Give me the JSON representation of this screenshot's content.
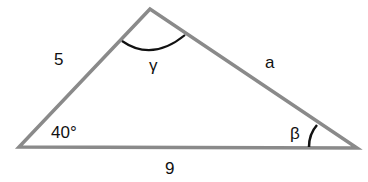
{
  "diagram": {
    "type": "triangle",
    "vertices": {
      "top": [
        150,
        9
      ],
      "left": [
        19,
        147
      ],
      "right": [
        357,
        148
      ]
    },
    "side_labels": {
      "left_side": "5",
      "right_side": "a",
      "base": "9"
    },
    "angle_labels": {
      "left_angle": "40°",
      "top_angle": "γ",
      "right_angle": "β"
    },
    "colors": {
      "stroke": "#888888",
      "arc": "#111111",
      "text": "#111111"
    }
  }
}
